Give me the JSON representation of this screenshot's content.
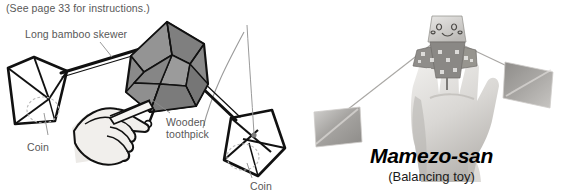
{
  "figure": {
    "note": "(See page 33 for instructions.)",
    "panels": {
      "diagram": {
        "name": "line-drawing-diagram",
        "labels": {
          "skewer": "Long bamboo skewer",
          "toothpick": "Wooden\ntoothpick",
          "coin_left": "Coin",
          "coin_right": "Coin"
        },
        "parts": {
          "origami_body": "gray folded paper balancing figure",
          "hand": "hand holding wooden toothpick",
          "pyramid_left": "paper pyramid weight with coin",
          "pyramid_right": "paper pyramid weight with coin",
          "motion_arc": "swing motion arc"
        }
      },
      "photo": {
        "name": "photograph-panel",
        "caption_title": "Mamezo-san",
        "caption_subtitle": "(Balancing toy)",
        "parts": {
          "hand": "photograph of a hand balancing the toy",
          "figure": "folded paper figure with drawn face",
          "weight_left": "square paper weight left",
          "weight_right": "square paper weight right"
        }
      }
    },
    "colors": {
      "background": "#ffffff",
      "label_text": "#585858",
      "caption_text": "#000000",
      "ink": "#111111",
      "origami_fill": "#8a8a8a",
      "origami_fill_dark": "#6e6e6e",
      "hand_fill": "#f0efed",
      "arc": "#9a9a9a",
      "photo_gray": "#b8b8b8"
    }
  }
}
